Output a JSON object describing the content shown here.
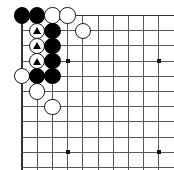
{
  "figure": {
    "kind": "go-board-diagram",
    "caption": "",
    "board": {
      "size": 19,
      "visible_columns": 10,
      "visible_rows": 10,
      "origin_corner": "top-left",
      "shows_top_edge": true,
      "shows_left_edge": true,
      "shows_right_edge": false,
      "shows_bottom_edge": false,
      "line_color": "#555555",
      "edge_line_color": "#333333",
      "background_color": "#ffffff",
      "geometry": {
        "left_x": 22,
        "top_y": 15.5,
        "cell": 15.2,
        "stone_diameter": 16.4
      }
    },
    "star_points": [
      {
        "col": 4,
        "row": 4
      },
      {
        "col": 10,
        "row": 4
      },
      {
        "col": 4,
        "row": 10
      },
      {
        "col": 10,
        "row": 10
      }
    ],
    "stones": [
      {
        "id": "b1",
        "color": "black",
        "col": 1,
        "row": 1,
        "mark": ""
      },
      {
        "id": "b2",
        "color": "black",
        "col": 2,
        "row": 1,
        "mark": ""
      },
      {
        "id": "w1",
        "color": "white",
        "col": 3,
        "row": 1,
        "mark": ""
      },
      {
        "id": "w2",
        "color": "white",
        "col": 4,
        "row": 1,
        "mark": ""
      },
      {
        "id": "w3",
        "color": "white",
        "col": 2,
        "row": 2,
        "mark": "triangle"
      },
      {
        "id": "b3",
        "color": "black",
        "col": 3,
        "row": 2,
        "mark": ""
      },
      {
        "id": "w4",
        "color": "white",
        "col": 5,
        "row": 2,
        "mark": ""
      },
      {
        "id": "w5",
        "color": "white",
        "col": 2,
        "row": 3,
        "mark": "triangle"
      },
      {
        "id": "b4",
        "color": "black",
        "col": 3,
        "row": 3,
        "mark": ""
      },
      {
        "id": "w6",
        "color": "white",
        "col": 2,
        "row": 4,
        "mark": "triangle"
      },
      {
        "id": "b5",
        "color": "black",
        "col": 3,
        "row": 4,
        "mark": ""
      },
      {
        "id": "w7",
        "color": "white",
        "col": 1,
        "row": 5,
        "mark": ""
      },
      {
        "id": "b6",
        "color": "black",
        "col": 2,
        "row": 5,
        "mark": ""
      },
      {
        "id": "b7",
        "color": "black",
        "col": 3,
        "row": 5,
        "mark": ""
      },
      {
        "id": "w8",
        "color": "white",
        "col": 2,
        "row": 6,
        "mark": ""
      },
      {
        "id": "w9",
        "color": "white",
        "col": 3,
        "row": 7,
        "mark": ""
      }
    ],
    "legend": {
      "triangle_meaning": "marked white stones"
    }
  }
}
